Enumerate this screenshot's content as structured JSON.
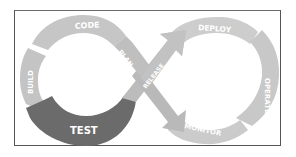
{
  "diagram": {
    "type": "devops-infinity-loop",
    "colors": {
      "segment": "#c6c6c6",
      "segment_alt": "#cfcfcf",
      "crossing": "#bababa",
      "highlight": "#6b6b6b",
      "text": "#ffffff",
      "border": "#555555"
    },
    "highlighted_stage": "TEST",
    "stages": [
      {
        "id": "code",
        "label": "CODE"
      },
      {
        "id": "plan",
        "label": "PLAN"
      },
      {
        "id": "release",
        "label": "RELEASE"
      },
      {
        "id": "deploy",
        "label": "DEPLOY"
      },
      {
        "id": "operate",
        "label": "OPERATE"
      },
      {
        "id": "monitor",
        "label": "MONITOR"
      },
      {
        "id": "test",
        "label": "TEST"
      },
      {
        "id": "build",
        "label": "BUILD"
      }
    ]
  }
}
